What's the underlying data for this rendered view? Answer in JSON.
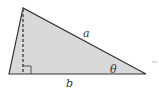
{
  "diagram": {
    "type": "triangle",
    "fill_color": "#d9d9d9",
    "stroke_color": "#333333",
    "labels": {
      "hypotenuse": "a",
      "base": "b",
      "angle": "θ"
    },
    "elements": [
      "altitude-dashed-line",
      "right-angle-marker"
    ]
  }
}
